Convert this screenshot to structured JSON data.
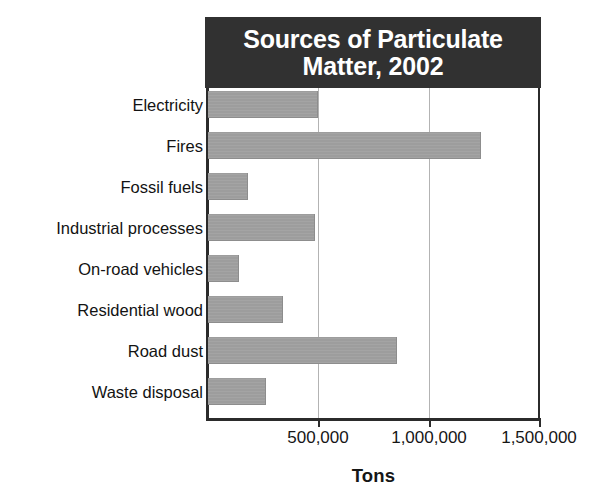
{
  "chart_data": {
    "type": "bar",
    "orientation": "horizontal",
    "title": "Sources of Particulate\nMatter, 2002",
    "title_line1": "Sources of Particulate",
    "title_line2": "Matter, 2002",
    "xlabel": "Tons",
    "ylabel": "",
    "categories": [
      "Electricity",
      "Fires",
      "Fossil fuels",
      "Industrial processes",
      "On-road vehicles",
      "Residential wood",
      "Road dust",
      "Waste disposal"
    ],
    "values": [
      500000,
      1235000,
      180000,
      485000,
      140000,
      340000,
      855000,
      263000
    ],
    "xlim": [
      0,
      1500000
    ],
    "xticks": [
      500000,
      1000000,
      1500000
    ],
    "xtick_labels": [
      "500,000",
      "1,000,000",
      "1,500,000"
    ],
    "grid": "vertical",
    "legend": "none",
    "colors": {
      "bar_fill": "#a0a0a0",
      "title_banner": "#313131",
      "title_text": "#ffffff",
      "axis": "#2b2b2b",
      "gridline": "#b3b3b3",
      "text": "#161616",
      "background": "#ffffff"
    }
  }
}
